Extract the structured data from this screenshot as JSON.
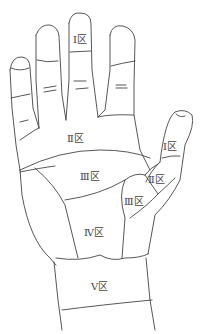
{
  "diagram": {
    "labels": {
      "finger_zone1": "Ⅰ区",
      "palm_zone2": "Ⅱ区",
      "palm_zone3": "Ⅲ区",
      "palm_zone4": "Ⅳ区",
      "wrist_zone5": "Ⅴ区",
      "thumb_zone1": "Ⅰ区",
      "thumb_zone2": "Ⅱ区",
      "thumb_zone3": "Ⅲ区"
    },
    "line_color": "#444444",
    "background": "#ffffff"
  }
}
